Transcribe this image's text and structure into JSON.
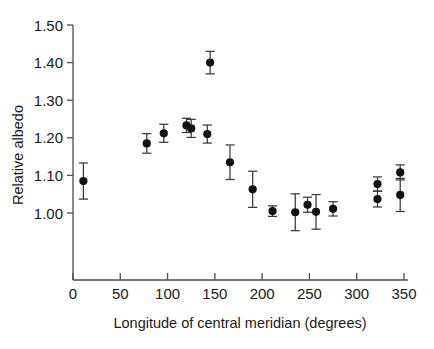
{
  "chart_data": {
    "type": "scatter",
    "title": "",
    "xlabel": "Longitude of central meridian (degrees)",
    "ylabel": "Relative albedo",
    "xlim": [
      0,
      354
    ],
    "ylim": [
      0.93,
      1.5
    ],
    "grid": false,
    "legend": null,
    "errorbars": "symmetric-vertical",
    "xticks": [
      0,
      50,
      100,
      150,
      200,
      250,
      300,
      350
    ],
    "xticklabels": [
      "0",
      "50",
      "100",
      "150",
      "200",
      "250",
      "300",
      "350"
    ],
    "yticks": [
      1.0,
      1.1,
      1.2,
      1.3,
      1.4,
      1.5
    ],
    "yticklabels": [
      "1.00",
      "1.10",
      "1.20",
      "1.30",
      "1.40",
      "1.50"
    ],
    "x": [
      11,
      78,
      96,
      120,
      125,
      142,
      145,
      166,
      190,
      211,
      235,
      248,
      257,
      275,
      322,
      322,
      346,
      346
    ],
    "y": [
      1.085,
      1.185,
      1.212,
      1.233,
      1.225,
      1.21,
      1.4,
      1.135,
      1.063,
      1.005,
      1.002,
      1.022,
      1.003,
      1.011,
      1.077,
      1.037,
      1.108,
      1.048
    ],
    "yerr": [
      0.048,
      0.026,
      0.024,
      0.019,
      0.024,
      0.024,
      0.03,
      0.046,
      0.048,
      0.014,
      0.049,
      0.02,
      0.046,
      0.019,
      0.019,
      0.021,
      0.02,
      0.044
    ],
    "points": [
      {
        "x": 11,
        "y": 1.085,
        "yerr": 0.048
      },
      {
        "x": 78,
        "y": 1.185,
        "yerr": 0.026
      },
      {
        "x": 96,
        "y": 1.212,
        "yerr": 0.024
      },
      {
        "x": 120,
        "y": 1.233,
        "yerr": 0.019
      },
      {
        "x": 125,
        "y": 1.225,
        "yerr": 0.024
      },
      {
        "x": 142,
        "y": 1.21,
        "yerr": 0.024
      },
      {
        "x": 145,
        "y": 1.4,
        "yerr": 0.03
      },
      {
        "x": 166,
        "y": 1.135,
        "yerr": 0.046
      },
      {
        "x": 190,
        "y": 1.063,
        "yerr": 0.048
      },
      {
        "x": 211,
        "y": 1.005,
        "yerr": 0.014
      },
      {
        "x": 235,
        "y": 1.002,
        "yerr": 0.049
      },
      {
        "x": 248,
        "y": 1.022,
        "yerr": 0.02
      },
      {
        "x": 257,
        "y": 1.003,
        "yerr": 0.046
      },
      {
        "x": 275,
        "y": 1.011,
        "yerr": 0.019
      },
      {
        "x": 322,
        "y": 1.077,
        "yerr": 0.019
      },
      {
        "x": 322,
        "y": 1.037,
        "yerr": 0.021
      },
      {
        "x": 346,
        "y": 1.108,
        "yerr": 0.02
      },
      {
        "x": 346,
        "y": 1.048,
        "yerr": 0.044
      }
    ],
    "colors": {
      "marker": "#111111",
      "errorbar": "#3a3a3a",
      "axis": "#4d4d4d",
      "text": "#1a1a1a",
      "background": "#ffffff"
    }
  }
}
